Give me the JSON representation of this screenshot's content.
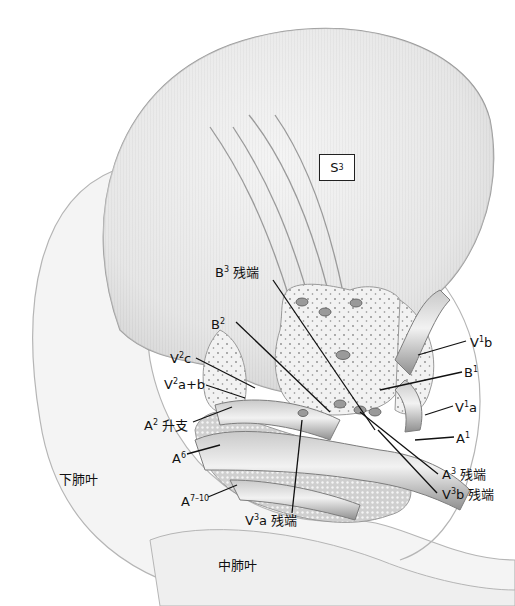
{
  "figure": {
    "segment_box": {
      "base": "S",
      "sup": "3"
    },
    "lobes": {
      "lower": "下肺叶",
      "middle": "中肺叶"
    },
    "labels": [
      {
        "id": "b3-stump",
        "base": "B",
        "sup": "3",
        "suffix": " 残端"
      },
      {
        "id": "b2",
        "base": "B",
        "sup": "2",
        "suffix": ""
      },
      {
        "id": "v2c",
        "base": "V",
        "sup": "2",
        "suffix": "c"
      },
      {
        "id": "v2ab",
        "base": "V",
        "sup": "2",
        "suffix": "a+b"
      },
      {
        "id": "a2-ascending",
        "base": "A",
        "sup": "2",
        "suffix": " 升支"
      },
      {
        "id": "a6",
        "base": "A",
        "sup": "6",
        "suffix": ""
      },
      {
        "id": "a7-10",
        "base": "A",
        "sup": "7–10",
        "suffix": ""
      },
      {
        "id": "v3a-stump",
        "base": "V",
        "sup": "3",
        "suffix": "a 残端"
      },
      {
        "id": "v1b",
        "base": "V",
        "sup": "1",
        "suffix": "b"
      },
      {
        "id": "b1",
        "base": "B",
        "sup": "1",
        "suffix": ""
      },
      {
        "id": "v1a",
        "base": "V",
        "sup": "1",
        "suffix": "a"
      },
      {
        "id": "a1",
        "base": "A",
        "sup": "1",
        "suffix": ""
      },
      {
        "id": "a3-stump",
        "base": "A",
        "sup": "3",
        "suffix": " 残端"
      },
      {
        "id": "v3b-stump",
        "base": "V",
        "sup": "3",
        "suffix": "b 残端"
      }
    ],
    "colors": {
      "lung_fill": "#e9e9e9",
      "lung_outline": "#9a9a9a",
      "vessel": "#a8a8a8",
      "vessel_dark": "#7d7d7d",
      "parenchyma_dots": "#8a8a8a",
      "leader_line": "#111111"
    }
  }
}
